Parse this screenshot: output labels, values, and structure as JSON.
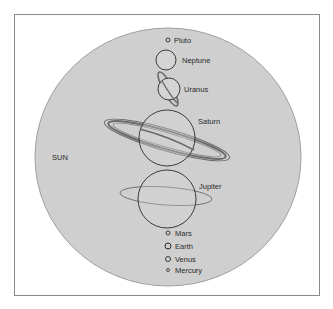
{
  "diagram": {
    "sun": {
      "label": "SUN",
      "fill": "#cfcfcf",
      "stroke": "#9a9a9a"
    },
    "planets": [
      {
        "name": "Pluto",
        "label": "Pluto"
      },
      {
        "name": "Neptune",
        "label": "Neptune"
      },
      {
        "name": "Uranus",
        "label": "Uranus"
      },
      {
        "name": "Saturn",
        "label": "Saturn"
      },
      {
        "name": "Jupiter",
        "label": "Jupiter"
      },
      {
        "name": "Mars",
        "label": "Mars"
      },
      {
        "name": "Earth",
        "label": "Earth"
      },
      {
        "name": "Venus",
        "label": "Venus"
      },
      {
        "name": "Mercury",
        "label": "Mercury"
      }
    ],
    "colors": {
      "outline": "#2a2a2a",
      "ring": "#6a6a6a",
      "frame": "#8a8a8a"
    }
  }
}
